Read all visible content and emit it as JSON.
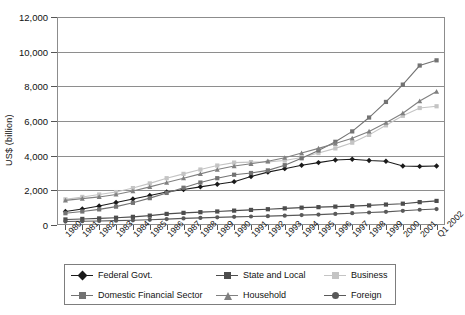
{
  "chart_data": {
    "type": "line",
    "title": "",
    "xlabel": "",
    "ylabel": "US$ (billion)",
    "ylim": [
      0,
      12000
    ],
    "ytick_step": 2000,
    "yticks": [
      "0",
      "2,000",
      "4,000",
      "6,000",
      "8,000",
      "10,000",
      "12,000"
    ],
    "grid": "horizontal",
    "legend_position": "below",
    "categories": [
      "1980",
      "1981",
      "1982",
      "1983",
      "1984",
      "1985",
      "1986",
      "1987",
      "1988",
      "1989",
      "1990",
      "1991",
      "1992",
      "1993",
      "1994",
      "1995",
      "1996",
      "1997",
      "1998",
      "1999",
      "2000",
      "2001",
      "Q1 2002"
    ],
    "series": [
      {
        "name": "Federal Govt.",
        "color": "#1a1a1a",
        "marker": "diamond",
        "values": [
          780,
          920,
          1100,
          1300,
          1500,
          1700,
          1900,
          2050,
          2200,
          2350,
          2500,
          2800,
          3050,
          3250,
          3450,
          3600,
          3750,
          3790,
          3720,
          3680,
          3400,
          3380,
          3400
        ]
      },
      {
        "name": "State and Local",
        "color": "#4d4d4d",
        "marker": "square",
        "values": [
          320,
          350,
          380,
          420,
          470,
          540,
          640,
          700,
          740,
          780,
          830,
          870,
          910,
          960,
          1000,
          1030,
          1060,
          1090,
          1130,
          1180,
          1230,
          1320,
          1390
        ]
      },
      {
        "name": "Business",
        "color": "#c4c4c4",
        "marker": "square",
        "values": [
          1480,
          1620,
          1760,
          1900,
          2130,
          2400,
          2700,
          2950,
          3200,
          3430,
          3600,
          3630,
          3640,
          3720,
          3890,
          4150,
          4420,
          4750,
          5200,
          5750,
          6300,
          6750,
          6850
        ]
      },
      {
        "name": "Domestic Financial Sector",
        "color": "#737373",
        "marker": "square",
        "values": [
          680,
          780,
          900,
          1060,
          1280,
          1550,
          1850,
          2150,
          2450,
          2700,
          2900,
          3000,
          3150,
          3450,
          3850,
          4300,
          4800,
          5400,
          6200,
          7100,
          8100,
          9200,
          9500
        ]
      },
      {
        "name": "Household",
        "color": "#808080",
        "marker": "triangle",
        "values": [
          1420,
          1520,
          1620,
          1760,
          1960,
          2200,
          2450,
          2700,
          2950,
          3200,
          3400,
          3530,
          3680,
          3880,
          4150,
          4420,
          4700,
          5000,
          5400,
          5900,
          6450,
          7150,
          7700
        ]
      },
      {
        "name": "Foreign",
        "color": "#595959",
        "marker": "circle",
        "values": [
          200,
          215,
          230,
          250,
          270,
          300,
          340,
          380,
          410,
          440,
          470,
          490,
          510,
          540,
          570,
          600,
          640,
          680,
          720,
          760,
          820,
          880,
          920
        ]
      }
    ]
  },
  "axes": {
    "y_title": "US$ (billion)"
  },
  "legend": {
    "items": [
      {
        "label": "Federal Govt."
      },
      {
        "label": "State and Local"
      },
      {
        "label": "Business"
      },
      {
        "label": "Domestic Financial Sector"
      },
      {
        "label": "Household"
      },
      {
        "label": "Foreign"
      }
    ]
  }
}
